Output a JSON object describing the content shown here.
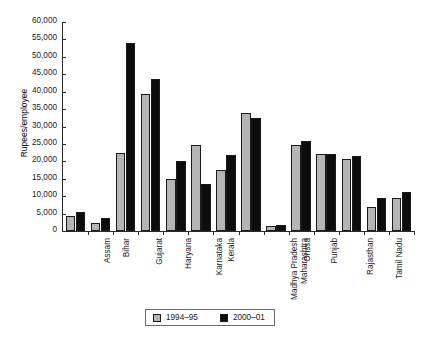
{
  "chart_data": {
    "type": "bar",
    "title": "",
    "xlabel": "",
    "ylabel": "Rupees/employee",
    "ylim": [
      0,
      60000
    ],
    "ytick_step": 5000,
    "grid": false,
    "legend_position": "bottom",
    "categories": [
      "Assam",
      "Bihar",
      "Gujarat",
      "Haryana",
      "Karnataka",
      "Kerala",
      "Madhya Pradesh",
      "Maharashtra",
      "Orissa",
      "Punjab",
      "Rajasthan",
      "Tamil Nadu",
      "Uttar Pradesh",
      "West Bengal"
    ],
    "ytick_labels": [
      "0",
      "5,000",
      "10,000",
      "15,000",
      "20,000",
      "25,000",
      "30,000",
      "35,000",
      "40,000",
      "45,000",
      "50,000",
      "55,000",
      "60,000"
    ],
    "series": [
      {
        "name": "1994–95",
        "color": "#b5b5b5",
        "values": [
          4200,
          2300,
          22500,
          39200,
          14800,
          24800,
          17500,
          34000,
          1300,
          24600,
          22200,
          20700,
          6800,
          9400
        ]
      },
      {
        "name": "2000–01",
        "color": "#0d0d0d",
        "values": [
          5500,
          3700,
          54000,
          43700,
          20000,
          13600,
          21800,
          32500,
          1600,
          25900,
          22200,
          21500,
          9400,
          11200
        ]
      }
    ]
  },
  "legend": {
    "entries": [
      {
        "label": "1994–95",
        "swatch": "gray-swatch-icon"
      },
      {
        "label": "2000–01",
        "swatch": "black-swatch-icon"
      }
    ]
  }
}
